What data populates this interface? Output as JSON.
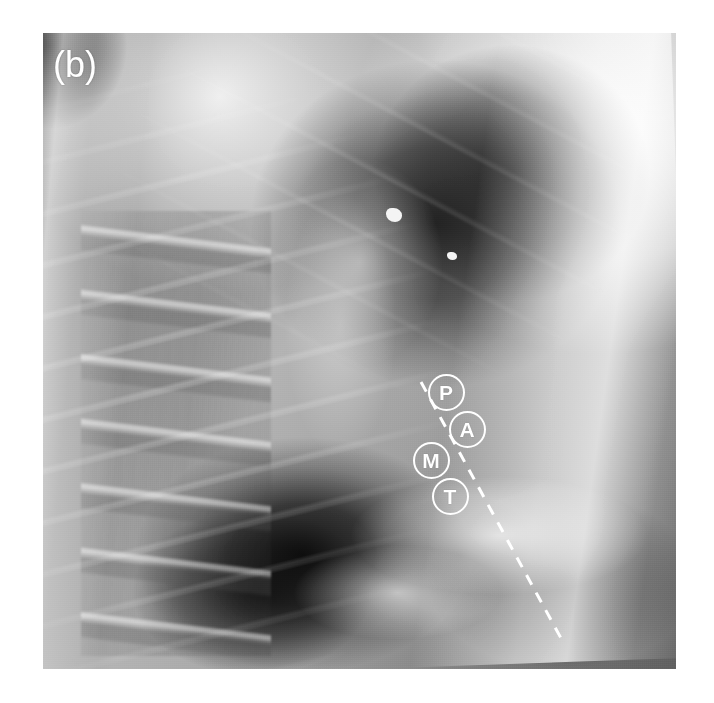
{
  "figure": {
    "panel_label": "(b)",
    "modality": "lateral chest radiograph",
    "background_color": "#ffffff",
    "plate": {
      "left": 43,
      "top": 33,
      "width": 633,
      "height": 636
    }
  },
  "annotations": {
    "markers": [
      {
        "id": "P",
        "label": "P",
        "meaning": "posterior mediastinum",
        "cx": 446,
        "cy": 392
      },
      {
        "id": "A",
        "label": "A",
        "meaning": "anterior mediastinum",
        "cx": 467,
        "cy": 429
      },
      {
        "id": "M",
        "label": "M",
        "meaning": "middle mediastinum",
        "cx": 431,
        "cy": 460
      },
      {
        "id": "T",
        "label": "T",
        "meaning": "thoracic marker",
        "cx": 450,
        "cy": 496
      }
    ],
    "marker_color": "#ffffff",
    "dashed_line": {
      "color": "#ffffff",
      "x1": 421,
      "y1": 382,
      "x2": 562,
      "y2": 640,
      "dash": "11 9",
      "width": 3
    }
  },
  "imaging_features": [
    {
      "name": "calcific-nodule-upper",
      "cx": 394,
      "cy": 215,
      "w": 16,
      "h": 14
    },
    {
      "name": "calcific-nodule-lower",
      "cx": 452,
      "cy": 256,
      "w": 10,
      "h": 8
    }
  ]
}
